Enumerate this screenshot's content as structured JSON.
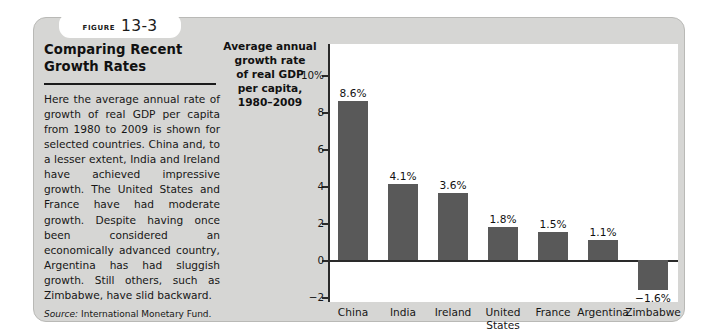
{
  "figure": {
    "badge_word": "Figure",
    "badge_number": "13-3"
  },
  "panel": {
    "title": "Comparing Recent\nGrowth Rates",
    "body": "Here the average annual rate of growth of real GDP per capita from 1980 to 2009 is shown for selected countries. China and, to a lesser extent, India and Ireland have achieved impressive growth. The United States and France have had moderate growth. Despite having once been considered an economically advanced country, Argentina has had sluggish growth. Still others, such as Zimbabwe, have slid backward.",
    "source_label": "Source:",
    "source_text": " International Monetary Fund."
  },
  "chart_data": {
    "type": "bar",
    "title": "Average annual\ngrowth rate\nof real GDP\nper capita,\n1980–2009",
    "xlabel": "",
    "ylabel": "Average annual growth rate of real GDP per capita, 1980-2009",
    "categories": [
      "China",
      "India",
      "Ireland",
      "United\nStates",
      "France",
      "Argentina",
      "Zimbabwe"
    ],
    "values": [
      8.6,
      4.1,
      3.6,
      1.8,
      1.5,
      1.1,
      -1.6
    ],
    "value_labels": [
      "8.6%",
      "4.1%",
      "3.6%",
      "1.8%",
      "1.5%",
      "1.1%",
      "−1.6%"
    ],
    "ylim": [
      -3,
      10
    ],
    "yticks": [
      10,
      8,
      6,
      4,
      2,
      0,
      -2
    ],
    "ytick_labels": [
      "10%",
      "8",
      "6",
      "4",
      "2",
      "0",
      "−2"
    ],
    "grid": false,
    "legend": false,
    "bar_color": "#595959",
    "plot_background": "#ffffff",
    "card_background": "#d6d6d4"
  }
}
